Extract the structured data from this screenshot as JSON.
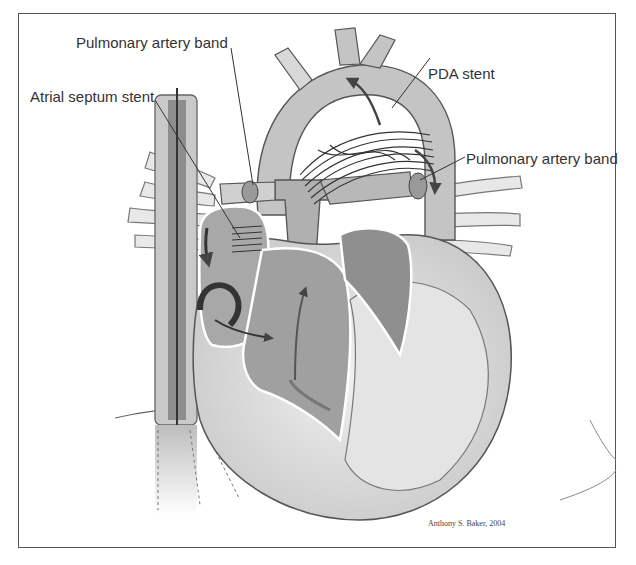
{
  "figure": {
    "type": "anatomical-illustration",
    "labels": [
      {
        "id": "pa-band-top",
        "text": "Pulmonary artery band"
      },
      {
        "id": "atrial-septum-stent",
        "text": "Atrial septum stent"
      },
      {
        "id": "pda-stent",
        "text": "PDA stent"
      },
      {
        "id": "pa-band-right",
        "text": "Pulmonary artery band"
      }
    ],
    "signature": "Anthony S. Baker, 2004",
    "colors": {
      "frame": "#555555",
      "tissue_light": "#e6e6e6",
      "tissue_mid": "#b4b4b4",
      "tissue_dark": "#8a8a8a",
      "arrow": "#444444",
      "stent": "#333333"
    }
  }
}
